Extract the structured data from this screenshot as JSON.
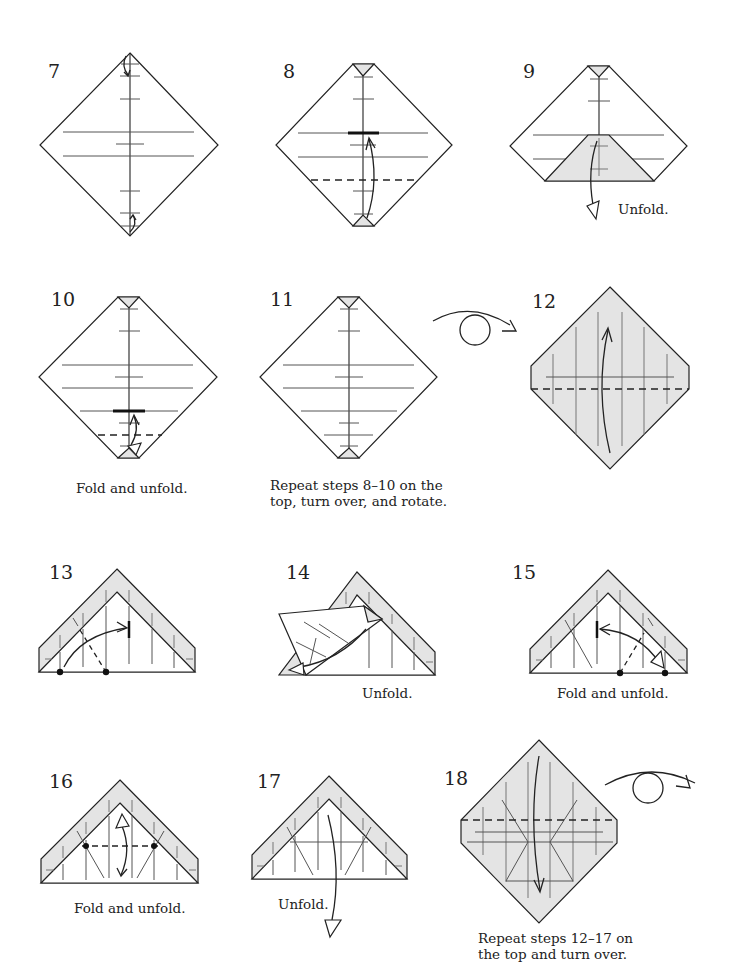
{
  "page": {
    "type": "origami-instruction-diagram",
    "background": "#ffffff",
    "paper_white": "#ffffff",
    "paper_colored": "#e4e4e4",
    "line_color": "#222222"
  },
  "steps": [
    {
      "number": "7",
      "caption": ""
    },
    {
      "number": "8",
      "caption": ""
    },
    {
      "number": "9",
      "caption": "Unfold."
    },
    {
      "number": "10",
      "caption": "Fold and unfold."
    },
    {
      "number": "11",
      "caption_line1": "Repeat steps 8–10 on the",
      "caption_line2": "top, turn over, and rotate."
    },
    {
      "number": "12",
      "caption": ""
    },
    {
      "number": "13",
      "caption": ""
    },
    {
      "number": "14",
      "caption": "Unfold."
    },
    {
      "number": "15",
      "caption": "Fold and unfold."
    },
    {
      "number": "16",
      "caption": "Fold and unfold."
    },
    {
      "number": "17",
      "caption": "Unfold."
    },
    {
      "number": "18",
      "caption_line1": "Repeat steps 12–17 on",
      "caption_line2": "the top and turn over."
    }
  ],
  "symbols": {
    "turn_over_1": "turn-over-icon",
    "turn_over_2": "turn-over-icon"
  }
}
